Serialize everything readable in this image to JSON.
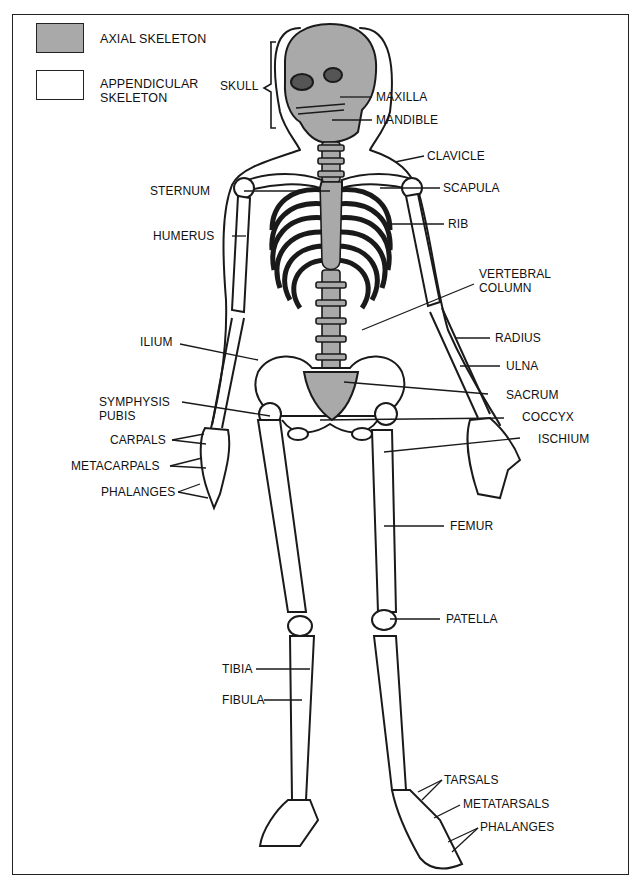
{
  "figure": {
    "colors": {
      "axial_fill": "#a9a9a9",
      "appendicular_fill": "#ffffff",
      "outline": "#1a1a1a"
    }
  },
  "legend": {
    "items": [
      {
        "label": "AXIAL SKELETON",
        "fill": "#a9a9a9"
      },
      {
        "label_line1": "APPENDICULAR",
        "label_line2": "SKELETON",
        "fill": "#ffffff"
      }
    ]
  },
  "labels": {
    "skull": "SKULL",
    "maxilla": "MAXILLA",
    "mandible": "MANDIBLE",
    "clavicle": "CLAVICLE",
    "sternum": "STERNUM",
    "scapula": "SCAPULA",
    "humerus": "HUMERUS",
    "rib": "RIB",
    "vertebral_column_line1": "VERTEBRAL",
    "vertebral_column_line2": "COLUMN",
    "ilium": "ILIUM",
    "radius": "RADIUS",
    "ulna": "ULNA",
    "sacrum": "SACRUM",
    "symphysis_pubis_line1": "SYMPHYSIS",
    "symphysis_pubis_line2": "PUBIS",
    "coccyx": "COCCYX",
    "carpals": "CARPALS",
    "ischium": "ISCHIUM",
    "metacarpals": "METACARPALS",
    "phalanges_hand": "PHALANGES",
    "femur": "FEMUR",
    "patella": "PATELLA",
    "tibia": "TIBIA",
    "fibula": "FIBULA",
    "tarsals": "TARSALS",
    "metatarsals": "METATARSALS",
    "phalanges_foot": "PHALANGES"
  }
}
